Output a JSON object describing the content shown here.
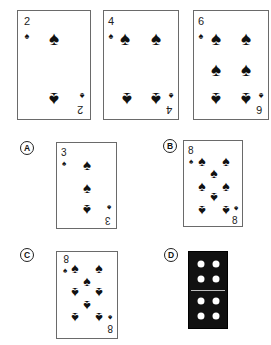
{
  "sequence": {
    "cards": [
      {
        "rank": "2",
        "suit": "spades",
        "suit_glyph": "♠"
      },
      {
        "rank": "4",
        "suit": "spades",
        "suit_glyph": "♠"
      },
      {
        "rank": "6",
        "suit": "spades",
        "suit_glyph": "♠"
      }
    ]
  },
  "options": [
    {
      "label": "A",
      "type": "card",
      "rank": "3",
      "suit": "spades",
      "suit_glyph": "♠",
      "orientation": "upright"
    },
    {
      "label": "B",
      "type": "card",
      "rank": "8",
      "suit": "spades",
      "suit_glyph": "♠",
      "orientation": "upright"
    },
    {
      "label": "C",
      "type": "card",
      "rank": "8",
      "suit": "spades",
      "suit_glyph": "♠",
      "orientation": "upside-down"
    },
    {
      "label": "D",
      "type": "domino",
      "top_dots": 4,
      "bottom_dots": 4
    }
  ]
}
